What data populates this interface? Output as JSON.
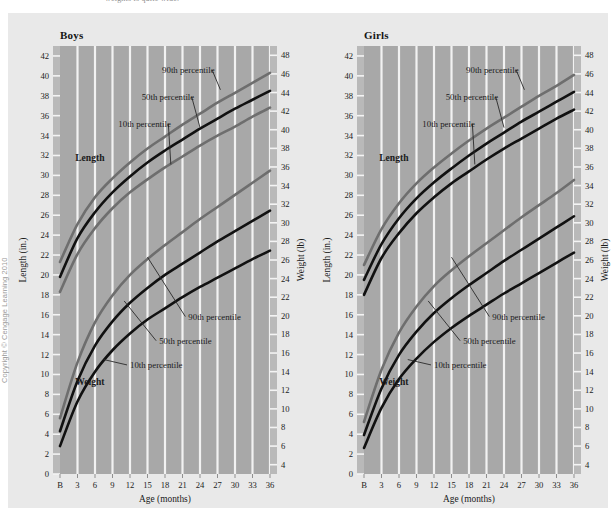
{
  "figure": {
    "clipped_caption_above": "weights is quite wide.",
    "copyright": "Copyright © Cengage Learning 2010",
    "plot_bg": "#a8a8a8",
    "plate_bg": "#e9e9e9",
    "gridline_color": "#f2f2f2",
    "dark_curve_color": "#111111",
    "gray_curve_color": "#6e6e6e",
    "leader_color": "#2a2a2a"
  },
  "chart_data": [
    {
      "type": "line",
      "title": "Boys",
      "xlabel": "Age (months)",
      "ylabel": "Length (in.)",
      "y2label": "Weight (lb)",
      "grid": true,
      "legend": "inline-annotations",
      "x": [
        0,
        3,
        6,
        9,
        12,
        15,
        18,
        21,
        24,
        27,
        30,
        33,
        36
      ],
      "xtick_labels": [
        "B",
        "3",
        "6",
        "9",
        "12",
        "15",
        "18",
        "21",
        "24",
        "27",
        "30",
        "33",
        "36"
      ],
      "ylim": [
        0,
        43
      ],
      "yticks": [
        0,
        2,
        4,
        6,
        8,
        10,
        12,
        14,
        16,
        18,
        20,
        22,
        24,
        26,
        28,
        30,
        32,
        34,
        36,
        38,
        40,
        42
      ],
      "y2lim": [
        3,
        49
      ],
      "y2ticks": [
        4,
        6,
        8,
        10,
        12,
        14,
        16,
        18,
        20,
        22,
        24,
        26,
        28,
        30,
        32,
        34,
        36,
        38,
        40,
        42,
        44,
        46,
        48
      ],
      "series": [
        {
          "name": "Length 90th percentile",
          "metric": "length",
          "unit": "in.",
          "axis": "left",
          "color": "#6e6e6e",
          "values": [
            21.3,
            25.1,
            27.8,
            29.7,
            31.3,
            32.7,
            33.9,
            35.1,
            36.2,
            37.3,
            38.3,
            39.3,
            40.3
          ]
        },
        {
          "name": "Length 50th percentile",
          "metric": "length",
          "unit": "in.",
          "axis": "left",
          "color": "#111111",
          "values": [
            19.8,
            23.7,
            26.3,
            28.3,
            29.9,
            31.3,
            32.5,
            33.6,
            34.7,
            35.7,
            36.7,
            37.6,
            38.5
          ]
        },
        {
          "name": "Length 10th percentile",
          "metric": "length",
          "unit": "in.",
          "axis": "left",
          "color": "#6e6e6e",
          "values": [
            18.3,
            22.1,
            24.7,
            26.7,
            28.3,
            29.6,
            30.8,
            31.9,
            33.0,
            34.0,
            34.9,
            35.9,
            36.8
          ]
        },
        {
          "name": "Weight 90th percentile",
          "metric": "weight",
          "unit": "lb",
          "axis": "right",
          "color": "#6e6e6e",
          "values": [
            9.0,
            15.0,
            19.3,
            22.2,
            24.4,
            26.1,
            27.6,
            29.0,
            30.4,
            31.7,
            33.0,
            34.3,
            35.6
          ]
        },
        {
          "name": "Weight 50th percentile",
          "metric": "weight",
          "unit": "lb",
          "axis": "right",
          "color": "#111111",
          "values": [
            7.6,
            13.0,
            16.8,
            19.4,
            21.4,
            23.0,
            24.4,
            25.6,
            26.8,
            28.0,
            29.1,
            30.2,
            31.3
          ]
        },
        {
          "name": "Weight 10th percentile",
          "metric": "weight",
          "unit": "lb",
          "axis": "right",
          "color": "#111111",
          "values": [
            6.0,
            10.8,
            14.0,
            16.3,
            18.1,
            19.6,
            20.8,
            22.0,
            23.1,
            24.1,
            25.1,
            26.1,
            27.0
          ]
        }
      ],
      "annotations": {
        "length_group_label": "Length",
        "weight_group_label": "Weight",
        "length_percentiles": [
          "90th percentile",
          "50th percentile",
          "10th percentile"
        ],
        "weight_percentiles": [
          "90th percentile",
          "50th percentile",
          "10th percentile"
        ]
      }
    },
    {
      "type": "line",
      "title": "Girls",
      "xlabel": "Age (months)",
      "ylabel": "Length (in.)",
      "y2label": "Weight (lb)",
      "grid": true,
      "legend": "inline-annotations",
      "x": [
        0,
        3,
        6,
        9,
        12,
        15,
        18,
        21,
        24,
        27,
        30,
        33,
        36
      ],
      "xtick_labels": [
        "B",
        "3",
        "6",
        "9",
        "12",
        "15",
        "18",
        "21",
        "24",
        "27",
        "30",
        "33",
        "36"
      ],
      "ylim": [
        0,
        43
      ],
      "yticks": [
        0,
        2,
        4,
        6,
        8,
        10,
        12,
        14,
        16,
        18,
        20,
        22,
        24,
        26,
        28,
        30,
        32,
        34,
        36,
        38,
        40,
        42
      ],
      "y2lim": [
        3,
        49
      ],
      "y2ticks": [
        4,
        6,
        8,
        10,
        12,
        14,
        16,
        18,
        20,
        22,
        24,
        26,
        28,
        30,
        32,
        34,
        36,
        38,
        40,
        42,
        44,
        46,
        48
      ],
      "series": [
        {
          "name": "Length 90th percentile",
          "metric": "length",
          "unit": "in.",
          "axis": "left",
          "color": "#6e6e6e",
          "values": [
            21.0,
            24.6,
            27.2,
            29.2,
            30.8,
            32.2,
            33.5,
            34.7,
            35.8,
            36.9,
            38.0,
            39.0,
            40.1
          ]
        },
        {
          "name": "Length 50th percentile",
          "metric": "length",
          "unit": "in.",
          "axis": "left",
          "color": "#111111",
          "values": [
            19.5,
            23.1,
            25.7,
            27.7,
            29.3,
            30.7,
            32.0,
            33.2,
            34.3,
            35.4,
            36.4,
            37.4,
            38.4
          ]
        },
        {
          "name": "Length 10th percentile",
          "metric": "length",
          "unit": "in.",
          "axis": "left",
          "color": "#111111",
          "values": [
            18.0,
            21.7,
            24.2,
            26.2,
            27.8,
            29.2,
            30.4,
            31.6,
            32.7,
            33.7,
            34.7,
            35.7,
            36.6
          ]
        },
        {
          "name": "Weight 90th percentile",
          "metric": "weight",
          "unit": "lb",
          "axis": "right",
          "color": "#6e6e6e",
          "values": [
            8.6,
            14.2,
            18.2,
            21.0,
            23.2,
            24.9,
            26.4,
            27.8,
            29.2,
            30.6,
            31.9,
            33.2,
            34.6
          ]
        },
        {
          "name": "Weight 50th percentile",
          "metric": "weight",
          "unit": "lb",
          "axis": "right",
          "color": "#111111",
          "values": [
            7.2,
            12.2,
            15.8,
            18.3,
            20.3,
            21.9,
            23.3,
            24.6,
            25.9,
            27.1,
            28.3,
            29.5,
            30.7
          ]
        },
        {
          "name": "Weight 10th percentile",
          "metric": "weight",
          "unit": "lb",
          "axis": "right",
          "color": "#111111",
          "values": [
            5.8,
            10.1,
            13.2,
            15.4,
            17.2,
            18.7,
            20.0,
            21.2,
            22.4,
            23.5,
            24.6,
            25.7,
            26.8
          ]
        }
      ],
      "annotations": {
        "length_group_label": "Length",
        "weight_group_label": "Weight",
        "length_percentiles": [
          "90th percentile",
          "50th percentile",
          "10th percentile"
        ],
        "weight_percentiles": [
          "90th percentile",
          "50th percentile",
          "10th percentile"
        ]
      }
    }
  ]
}
